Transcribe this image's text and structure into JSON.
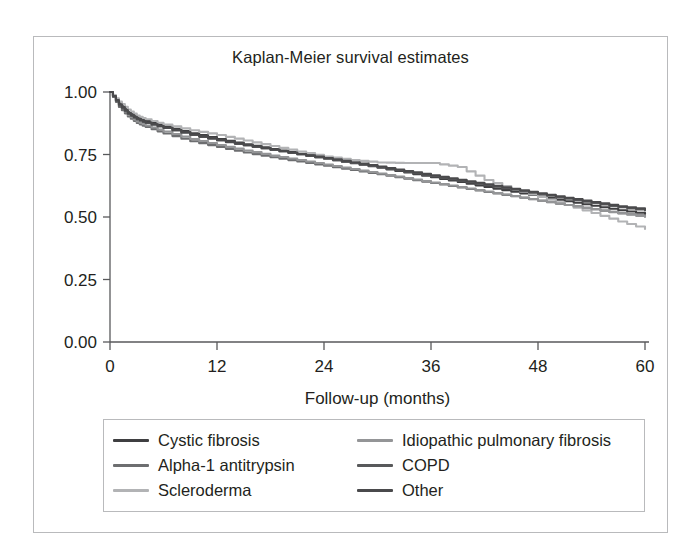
{
  "chart_data": {
    "type": "line",
    "title": "Kaplan-Meier survival estimates",
    "xlabel": "Follow-up (months)",
    "ylabel": "",
    "xlim": [
      0,
      60
    ],
    "ylim": [
      0,
      1.0
    ],
    "xticks": [
      0,
      12,
      24,
      36,
      48,
      60
    ],
    "xtick_labels": [
      "0",
      "12",
      "24",
      "36",
      "48",
      "60"
    ],
    "yticks": [
      0.0,
      0.25,
      0.5,
      0.75,
      1.0
    ],
    "ytick_labels": [
      "0.00",
      "0.25",
      "0.50",
      "0.75",
      "1.00"
    ],
    "grid": false,
    "legend_position": "below-plot",
    "legend_columns": 2,
    "x": [
      0,
      1,
      2,
      3,
      4,
      6,
      9,
      12,
      15,
      18,
      21,
      24,
      27,
      30,
      33,
      36,
      39,
      42,
      45,
      48,
      51,
      54,
      57,
      60
    ],
    "series": [
      {
        "name": "Cystic fibrosis",
        "color": "#3f3f41",
        "values": [
          1.0,
          0.955,
          0.92,
          0.898,
          0.884,
          0.862,
          0.835,
          0.812,
          0.791,
          0.772,
          0.753,
          0.734,
          0.715,
          0.697,
          0.678,
          0.659,
          0.64,
          0.62,
          0.601,
          0.582,
          0.563,
          0.545,
          0.527,
          0.512
        ]
      },
      {
        "name": "Alpha-1 antitrypsin",
        "color": "#6d6e70",
        "values": [
          1.0,
          0.94,
          0.902,
          0.876,
          0.86,
          0.834,
          0.803,
          0.78,
          0.758,
          0.739,
          0.722,
          0.705,
          0.688,
          0.671,
          0.653,
          0.636,
          0.618,
          0.6,
          0.583,
          0.565,
          0.548,
          0.531,
          0.515,
          0.503
        ]
      },
      {
        "name": "Scleroderma",
        "color": "#b2b3b5",
        "values": [
          1.0,
          0.962,
          0.93,
          0.906,
          0.891,
          0.87,
          0.847,
          0.828,
          0.806,
          0.784,
          0.762,
          0.742,
          0.728,
          0.718,
          0.716,
          0.716,
          0.7,
          0.648,
          0.612,
          0.58,
          0.548,
          0.516,
          0.482,
          0.452
        ]
      },
      {
        "name": "Idiopathic pulmonary fibrosis",
        "color": "#949597",
        "values": [
          1.0,
          0.948,
          0.908,
          0.882,
          0.866,
          0.842,
          0.812,
          0.788,
          0.766,
          0.746,
          0.728,
          0.71,
          0.692,
          0.674,
          0.656,
          0.638,
          0.62,
          0.602,
          0.584,
          0.566,
          0.548,
          0.531,
          0.514,
          0.5
        ]
      },
      {
        "name": "COPD",
        "color": "#58595b",
        "values": [
          1.0,
          0.946,
          0.912,
          0.89,
          0.876,
          0.856,
          0.828,
          0.806,
          0.786,
          0.768,
          0.75,
          0.733,
          0.716,
          0.699,
          0.681,
          0.663,
          0.645,
          0.627,
          0.609,
          0.591,
          0.573,
          0.556,
          0.539,
          0.526
        ]
      },
      {
        "name": "Other",
        "color": "#4a4a4c",
        "values": [
          1.0,
          0.951,
          0.916,
          0.893,
          0.878,
          0.857,
          0.83,
          0.808,
          0.788,
          0.77,
          0.752,
          0.736,
          0.719,
          0.702,
          0.684,
          0.667,
          0.649,
          0.631,
          0.613,
          0.595,
          0.577,
          0.56,
          0.543,
          0.53
        ]
      }
    ]
  },
  "legend": {
    "entries": [
      {
        "label": "Cystic fibrosis",
        "color": "#3f3f41"
      },
      {
        "label": "Idiopathic pulmonary fibrosis",
        "color": "#949597"
      },
      {
        "label": "Alpha-1 antitrypsin",
        "color": "#6d6e70"
      },
      {
        "label": "COPD",
        "color": "#58595b"
      },
      {
        "label": "Scleroderma",
        "color": "#b2b3b5"
      },
      {
        "label": "Other",
        "color": "#4a4a4c"
      }
    ]
  },
  "style": {
    "frame_color": "#b9babc",
    "axis_color": "#58595b",
    "text_color": "#231f20",
    "background": "#ffffff"
  }
}
